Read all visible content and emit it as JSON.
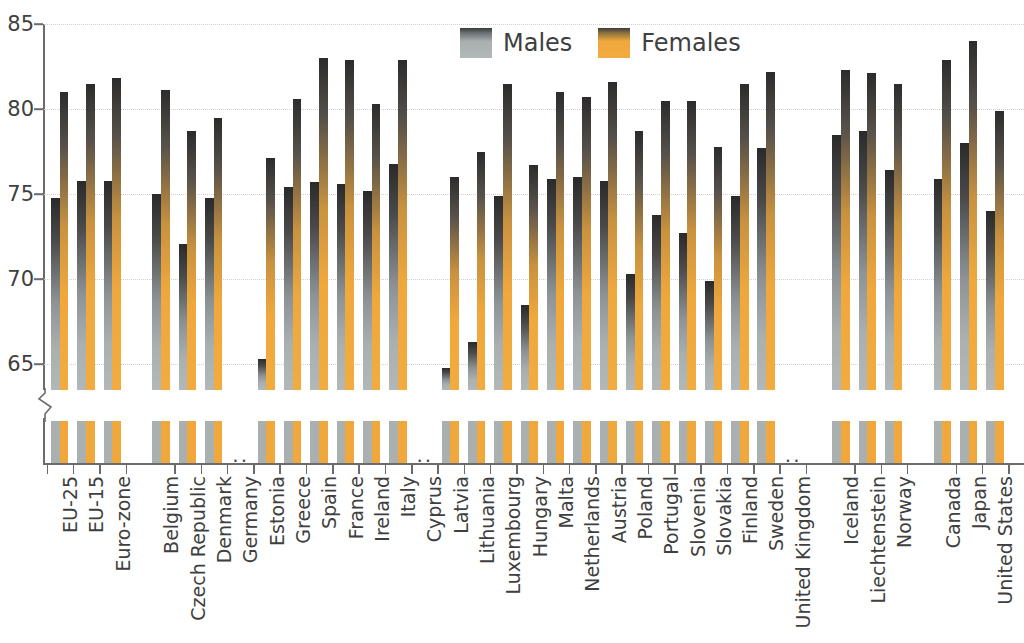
{
  "chart_data": {
    "type": "bar",
    "title": "",
    "subtitle": "",
    "xlabel": "",
    "ylabel": "",
    "ylim": [
      63.5,
      85
    ],
    "y_ticks": [
      65,
      70,
      75,
      80,
      85
    ],
    "grid": true,
    "axis_break": true,
    "legend_position": "top-center",
    "missing_marker": "..",
    "categories": [
      "EU-25",
      "EU-15",
      "Euro-zone",
      "Belgium",
      "Czech Republic",
      "Denmark",
      "Germany",
      "Estonia",
      "Greece",
      "Spain",
      "France",
      "Ireland",
      "Italy",
      "Cyprus",
      "Latvia",
      "Lithuania",
      "Luxembourg",
      "Hungary",
      "Malta",
      "Netherlands",
      "Austria",
      "Poland",
      "Portugal",
      "Slovenia",
      "Slovakia",
      "Finland",
      "Sweden",
      "United Kingdom",
      "Iceland",
      "Liechtenstein",
      "Norway",
      "Canada",
      "Japan",
      "United States"
    ],
    "group_breaks_after": [
      "Euro-zone",
      "United Kingdom",
      "Norway"
    ],
    "series": [
      {
        "name": "Males",
        "color": "#aab0b0",
        "values": [
          74.8,
          75.8,
          75.8,
          75.0,
          72.1,
          74.8,
          null,
          65.3,
          75.4,
          75.7,
          75.6,
          75.2,
          76.8,
          null,
          64.8,
          66.3,
          74.9,
          68.5,
          75.9,
          76.0,
          75.8,
          70.3,
          73.8,
          72.7,
          69.9,
          74.9,
          77.7,
          null,
          78.5,
          78.7,
          76.4,
          75.9,
          78.0,
          74.0
        ]
      },
      {
        "name": "Females",
        "color": "#f0a83c",
        "values": [
          81.0,
          81.5,
          81.8,
          81.1,
          78.7,
          79.5,
          null,
          77.1,
          80.6,
          83.0,
          82.9,
          80.3,
          82.9,
          null,
          76.0,
          77.5,
          81.5,
          76.7,
          81.0,
          80.7,
          81.6,
          78.7,
          80.5,
          80.5,
          77.8,
          81.5,
          82.2,
          null,
          82.3,
          82.1,
          81.5,
          82.9,
          84.0,
          79.9
        ]
      }
    ]
  },
  "legend": {
    "items": [
      {
        "label": "Males",
        "color": "#aab0b0"
      },
      {
        "label": "Females",
        "color": "#f0a83c"
      }
    ]
  }
}
